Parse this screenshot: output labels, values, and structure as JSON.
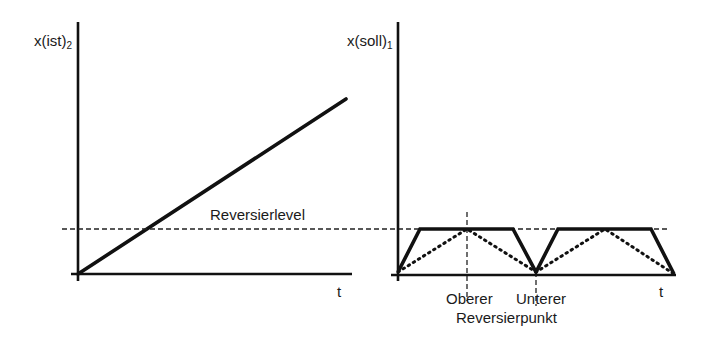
{
  "diagram": {
    "left_panel": {
      "y_axis_label": "x(ist)",
      "y_axis_subscript": "2",
      "x_axis_label": "t",
      "level_label": "Reversierlevel",
      "series": {
        "name": "x(ist)2",
        "style": "solid-thick",
        "points": [
          [
            78,
            274
          ],
          [
            346,
            99
          ]
        ]
      }
    },
    "right_panel": {
      "y_axis_label": "x(soll)",
      "y_axis_subscript": "1",
      "x_axis_label": "t",
      "series": [
        {
          "name": "x(soll)1 trapezoid",
          "style": "solid-thick",
          "points": [
            [
              398,
              272
            ],
            [
              420,
              229
            ],
            [
              513,
              229
            ],
            [
              536,
              272
            ],
            [
              558,
              229
            ],
            [
              651,
              229
            ],
            [
              674,
              274
            ]
          ]
        },
        {
          "name": "triangle reference",
          "style": "dotted",
          "points": [
            [
              398,
              272
            ],
            [
              467,
              229
            ],
            [
              536,
              272
            ],
            [
              605,
              229
            ],
            [
              674,
              274
            ]
          ]
        }
      ],
      "markers": {
        "upper_label": "Oberer",
        "lower_label": "Unterer",
        "caption": "Reversierpunkt"
      }
    },
    "reversal_level_line": {
      "style": "dashed",
      "y": 229,
      "x_from": 62,
      "x_to": 667
    },
    "colors": {
      "line": "#111111",
      "background": "#ffffff"
    }
  }
}
